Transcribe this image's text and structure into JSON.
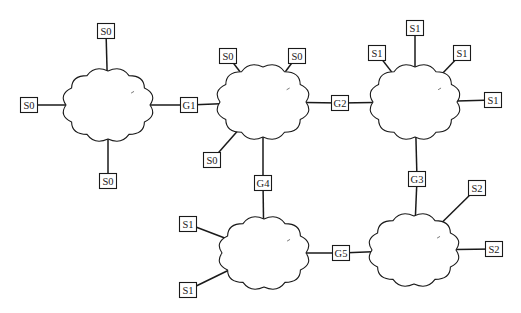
{
  "diagram": {
    "colors": {
      "line": "#1a1a1a",
      "background": "#ffffff",
      "box_fill": "#ffffff"
    },
    "clouds": [
      {
        "id": "cloud-1",
        "cx": 108,
        "cy": 105,
        "rx": 42,
        "ry": 34
      },
      {
        "id": "cloud-2",
        "cx": 263,
        "cy": 102,
        "rx": 43,
        "ry": 35
      },
      {
        "id": "cloud-3",
        "cx": 415,
        "cy": 102,
        "rx": 42,
        "ry": 35
      },
      {
        "id": "cloud-4",
        "cx": 264,
        "cy": 253,
        "rx": 42,
        "ry": 34
      },
      {
        "id": "cloud-5",
        "cx": 414,
        "cy": 250,
        "rx": 42,
        "ry": 34
      }
    ],
    "gateways": [
      {
        "label": "G1",
        "x": 189,
        "y": 105,
        "connects": [
          "cloud-1",
          "cloud-2"
        ]
      },
      {
        "label": "G2",
        "x": 340,
        "y": 103,
        "connects": [
          "cloud-2",
          "cloud-3"
        ]
      },
      {
        "label": "G3",
        "x": 417,
        "y": 179,
        "connects": [
          "cloud-3",
          "cloud-5"
        ]
      },
      {
        "label": "G4",
        "x": 263,
        "y": 183,
        "connects": [
          "cloud-2",
          "cloud-4"
        ]
      },
      {
        "label": "G5",
        "x": 341,
        "y": 253,
        "connects": [
          "cloud-4",
          "cloud-5"
        ]
      }
    ],
    "stations": [
      {
        "label": "S0",
        "x": 106,
        "y": 31,
        "cloud": "cloud-1"
      },
      {
        "label": "S0",
        "x": 29,
        "y": 105,
        "cloud": "cloud-1"
      },
      {
        "label": "S0",
        "x": 108,
        "y": 181,
        "cloud": "cloud-1"
      },
      {
        "label": "S0",
        "x": 228,
        "y": 56,
        "cloud": "cloud-2"
      },
      {
        "label": "S0",
        "x": 297,
        "y": 56,
        "cloud": "cloud-2"
      },
      {
        "label": "S0",
        "x": 212,
        "y": 160,
        "cloud": "cloud-2"
      },
      {
        "label": "S1",
        "x": 415,
        "y": 28,
        "cloud": "cloud-3"
      },
      {
        "label": "S1",
        "x": 377,
        "y": 53,
        "cloud": "cloud-3"
      },
      {
        "label": "S1",
        "x": 462,
        "y": 53,
        "cloud": "cloud-3"
      },
      {
        "label": "S1",
        "x": 493,
        "y": 100,
        "cloud": "cloud-3"
      },
      {
        "label": "S1",
        "x": 188,
        "y": 224,
        "cloud": "cloud-4"
      },
      {
        "label": "S1",
        "x": 188,
        "y": 290,
        "cloud": "cloud-4"
      },
      {
        "label": "S2",
        "x": 477,
        "y": 188,
        "cloud": "cloud-5"
      },
      {
        "label": "S2",
        "x": 494,
        "y": 249,
        "cloud": "cloud-5"
      }
    ]
  }
}
